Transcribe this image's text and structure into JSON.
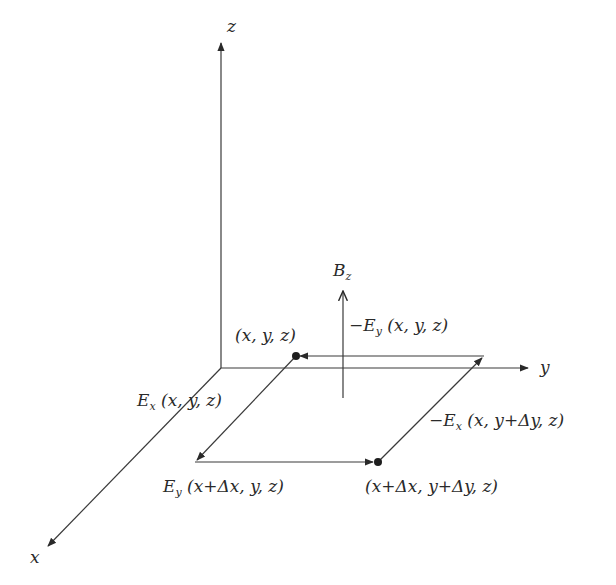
{
  "diagram": {
    "title": "",
    "axes": {
      "x": {
        "label": "x"
      },
      "y": {
        "label": "y"
      },
      "z": {
        "label": "z"
      }
    },
    "field": {
      "symbol": "B",
      "subscript": "z"
    },
    "corners": {
      "a": "(x, y, z)",
      "c": "(x+Δx, y+Δy, z)"
    },
    "edges": {
      "top": {
        "sign": "−",
        "symbol": "E",
        "subscript": "y",
        "args": " (x, y, z)"
      },
      "left": {
        "sign": "",
        "symbol": "E",
        "subscript": "x",
        "args": " (x, y, z)"
      },
      "bottom": {
        "sign": "",
        "symbol": "E",
        "subscript": "y",
        "args": " (x+Δx, y, z)"
      },
      "right": {
        "sign": "−",
        "symbol": "E",
        "subscript": "x",
        "args": " (x, y+Δy, z)"
      }
    },
    "colors": {
      "line": "#3a3a3a",
      "text": "#2a2a2a",
      "background": "#ffffff"
    }
  }
}
